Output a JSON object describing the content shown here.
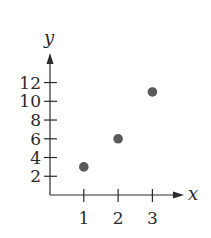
{
  "chart_data": {
    "type": "scatter",
    "title": "",
    "xlabel": "x",
    "ylabel": "y",
    "x": [
      1,
      2,
      3
    ],
    "y": [
      3,
      6,
      11
    ],
    "xticks": [
      "1",
      "2",
      "3"
    ],
    "yticks": [
      "2",
      "4",
      "6",
      "8",
      "10",
      "12"
    ],
    "xlim": [
      0,
      3.5
    ],
    "ylim": [
      0,
      14
    ],
    "grid": false,
    "legend": null,
    "point_color": "#5a5a5a",
    "axis_color": "#2a2a2a"
  }
}
